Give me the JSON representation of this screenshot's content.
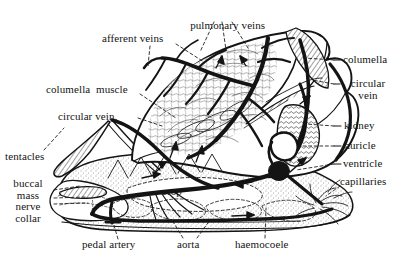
{
  "figure": {
    "kind": "anatomical-diagram",
    "background_color": "#ffffff",
    "ink_color": "#141414",
    "width": 400,
    "height": 260
  },
  "labels": [
    {
      "id": "pulmonary-veins",
      "text": "pulmonary veins",
      "x": 222,
      "y": 14,
      "align": "ctr"
    },
    {
      "id": "afferent-veins",
      "text": "afferent veins",
      "x": 152,
      "y": 39,
      "align": "ctr"
    },
    {
      "id": "columella-muscle",
      "text": "columella  muscle",
      "x": 98,
      "y": 90,
      "align": "ctr"
    },
    {
      "id": "circular-vein-left",
      "text": "circular vein.",
      "x": 97,
      "y": 117,
      "align": "ctr"
    },
    {
      "id": "tentacles",
      "text": "tentacles",
      "x": 32,
      "y": 157,
      "align": "ctr"
    },
    {
      "id": "buccal-mass-nerve-collar",
      "text": "buccal\nmass\nnerve\ncollar",
      "x": 28,
      "y": 196,
      "align": "ctr"
    },
    {
      "id": "crop",
      "text": "crop",
      "x": 177,
      "y": 192,
      "align": "ctr"
    },
    {
      "id": "pedal-artery",
      "text": "pedal artery",
      "x": 115,
      "y": 245,
      "align": "ctr"
    },
    {
      "id": "aorta",
      "text": "aorta",
      "x": 190,
      "y": 245,
      "align": "ctr"
    },
    {
      "id": "haemocoele",
      "text": "haemocoele",
      "x": 265,
      "y": 245,
      "align": "ctr"
    },
    {
      "id": "columella",
      "text": "columella",
      "x": 368,
      "y": 60,
      "align": "ctr"
    },
    {
      "id": "circular-vein-right",
      "text": "circular\nvein",
      "x": 368,
      "y": 88,
      "align": "ctr"
    },
    {
      "id": "kidney",
      "text": "kidney",
      "x": 362,
      "y": 126,
      "align": "ctr"
    },
    {
      "id": "auricle",
      "text": "auricle",
      "x": 363,
      "y": 146,
      "align": "ctr"
    },
    {
      "id": "ventricle",
      "text": "ventricle",
      "x": 366,
      "y": 164,
      "align": "ctr"
    },
    {
      "id": "capillaries",
      "text": "capillaries",
      "x": 366,
      "y": 182,
      "align": "ctr"
    }
  ],
  "structures": [
    {
      "id": "shell-mantle",
      "name": "shell and mantle cavity (lung)"
    },
    {
      "id": "lung-vein-network",
      "name": "pulmonary vein network"
    },
    {
      "id": "columella-muscle-body",
      "name": "columella muscle (striated)"
    },
    {
      "id": "kidney-body",
      "name": "kidney"
    },
    {
      "id": "auricle-body",
      "name": "auricle"
    },
    {
      "id": "ventricle-body",
      "name": "ventricle"
    },
    {
      "id": "aorta-vessel",
      "name": "aorta"
    },
    {
      "id": "pedal-artery-vessel",
      "name": "pedal artery"
    },
    {
      "id": "crop-body",
      "name": "crop"
    },
    {
      "id": "buccal-mass-body",
      "name": "buccal mass"
    },
    {
      "id": "tentacle-pair",
      "name": "tentacles"
    },
    {
      "id": "foot",
      "name": "foot"
    },
    {
      "id": "capillary-tuft",
      "name": "capillaries"
    },
    {
      "id": "haemocoele-space",
      "name": "haemocoele"
    }
  ]
}
